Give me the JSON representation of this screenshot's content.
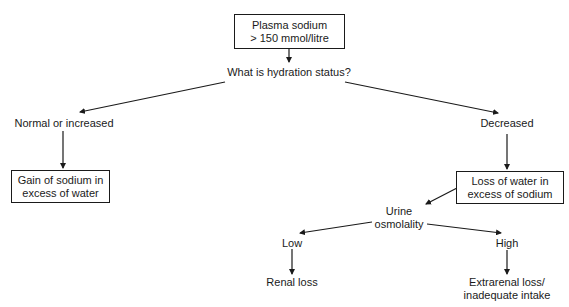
{
  "diagram": {
    "type": "flowchart",
    "nodes": {
      "root": {
        "line1": "Plasma sodium",
        "line2": "> 150 mmol/litre",
        "boxed": true
      },
      "question": {
        "text": "What is hydration status?"
      },
      "normal": {
        "text": "Normal or increased"
      },
      "decreased": {
        "text": "Decreased"
      },
      "gain": {
        "line1": "Gain of sodium in",
        "line2": "excess of water",
        "boxed": true
      },
      "loss": {
        "line1": "Loss of water in",
        "line2": "excess of sodium",
        "boxed": true
      },
      "urine": {
        "line1": "Urine",
        "line2": "osmolality"
      },
      "low": {
        "text": "Low"
      },
      "high": {
        "text": "High"
      },
      "renal": {
        "text": "Renal loss"
      },
      "extrarenal": {
        "line1": "Extrarenal loss/",
        "line2": "inadequate intake"
      }
    },
    "edges": [
      {
        "from": "root",
        "to": "question"
      },
      {
        "from": "question",
        "to": "normal"
      },
      {
        "from": "question",
        "to": "decreased"
      },
      {
        "from": "normal",
        "to": "gain"
      },
      {
        "from": "decreased",
        "to": "loss"
      },
      {
        "from": "loss",
        "to": "urine"
      },
      {
        "from": "urine",
        "to": "low"
      },
      {
        "from": "urine",
        "to": "high"
      },
      {
        "from": "low",
        "to": "renal"
      },
      {
        "from": "high",
        "to": "extrarenal"
      }
    ],
    "colors": {
      "stroke": "#1a1a1a",
      "background": "#ffffff"
    }
  }
}
